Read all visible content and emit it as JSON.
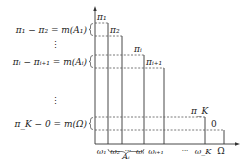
{
  "diagram": {
    "type": "step-function-decomposition",
    "colors": {
      "line": "#333333",
      "dashed": "#555555",
      "text": "#222222"
    },
    "left_labels": [
      {
        "id": "pi1-pi2",
        "text": "π₁ − π₂ = m(A₁)"
      },
      {
        "id": "vdots-1",
        "text": "⋮"
      },
      {
        "id": "pii-pii1",
        "text": "πᵢ − πᵢ₊₁ = m(Aᵢ)"
      },
      {
        "id": "vdots-2",
        "text": "⋮"
      },
      {
        "id": "piK-0",
        "text": "π_K − 0 = m(Ω)"
      }
    ],
    "step_labels": {
      "pi1": "π₁",
      "pi2": "π₂",
      "pii": "πᵢ",
      "pii1": "πᵢ₊₁",
      "piK": "π_K",
      "zero": "0"
    },
    "x_axis_labels": {
      "w1": "ω₁",
      "w2": "ω₂",
      "dots1": "···",
      "wi": "ωᵢ",
      "wi1": "ωᵢ₊₁",
      "dots2": "···",
      "wK": "ω_K",
      "omega": "Ω"
    },
    "brace_label": "Aᵢ"
  }
}
